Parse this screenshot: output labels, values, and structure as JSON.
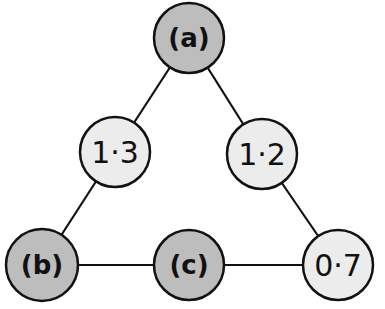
{
  "diagram": {
    "type": "triangle-graph",
    "colors": {
      "unknown_fill": "#bdbdbd",
      "known_fill": "#ececec",
      "stroke": "#111111",
      "background": "#ffffff"
    },
    "nodes": [
      {
        "id": "a",
        "label": "(a)",
        "kind": "unknown",
        "cx": 189,
        "cy": 38
      },
      {
        "id": "n13",
        "label": "1·3",
        "kind": "known",
        "cx": 115,
        "cy": 152
      },
      {
        "id": "n12",
        "label": "1·2",
        "kind": "known",
        "cx": 262,
        "cy": 154
      },
      {
        "id": "b",
        "label": "(b)",
        "kind": "unknown",
        "cx": 42,
        "cy": 265
      },
      {
        "id": "c",
        "label": "(c)",
        "kind": "unknown",
        "cx": 189,
        "cy": 265
      },
      {
        "id": "n07",
        "label": "0·7",
        "kind": "known",
        "cx": 338,
        "cy": 265
      }
    ],
    "edges": [
      [
        "a",
        "n13"
      ],
      [
        "a",
        "n12"
      ],
      [
        "n13",
        "b"
      ],
      [
        "n12",
        "n07"
      ],
      [
        "b",
        "c"
      ],
      [
        "c",
        "n07"
      ]
    ]
  }
}
